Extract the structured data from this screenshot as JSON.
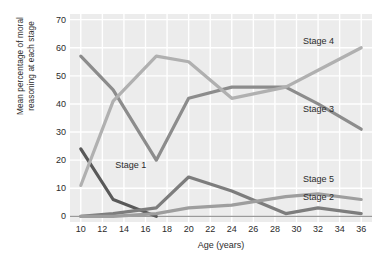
{
  "chart_data": {
    "type": "line",
    "title": "",
    "xlabel": "Age (years)",
    "ylabel": "Mean percentage of moral\nreasoning at each stage",
    "xlim": [
      9,
      37
    ],
    "ylim": [
      -2,
      72
    ],
    "yticks": [
      0,
      10,
      20,
      30,
      40,
      50,
      60,
      70
    ],
    "xticks": [
      10,
      12,
      14,
      16,
      18,
      20,
      22,
      24,
      26,
      28,
      30,
      32,
      34,
      36
    ],
    "grid": true,
    "legend": "inline-series-labels",
    "x": [
      10,
      13,
      17,
      20,
      24,
      29,
      32,
      36
    ],
    "series": [
      {
        "name": "Stage 1",
        "color": "#595959",
        "x": [
          10,
          13,
          17
        ],
        "values": [
          24,
          6,
          0
        ],
        "label": "Stage 1",
        "label_x": 13.2,
        "label_y": 18
      },
      {
        "name": "Stage 2",
        "color": "#7d7d7d",
        "x": [
          10,
          13,
          17,
          20,
          24,
          29,
          32,
          36
        ],
        "values": [
          0,
          1,
          3,
          14,
          9,
          1,
          3,
          1
        ],
        "label": "Stage 2",
        "label_x": 30.6,
        "label_y": 6.5
      },
      {
        "name": "Stage 3",
        "color": "#8c8c8c",
        "x": [
          10,
          13,
          17,
          20,
          24,
          29,
          32,
          36
        ],
        "values": [
          57,
          45,
          20,
          42,
          46,
          46,
          40,
          31
        ],
        "label": "Stage 3",
        "label_x": 30.6,
        "label_y": 38
      },
      {
        "name": "Stage 4",
        "color": "#b0b0b0",
        "x": [
          10,
          13,
          17,
          20,
          24,
          29,
          32,
          36
        ],
        "values": [
          11,
          41,
          57,
          55,
          42,
          46,
          52,
          60
        ],
        "label": "Stage 4",
        "label_x": 30.6,
        "label_y": 62
      },
      {
        "name": "Stage 5",
        "color": "#9e9e9e",
        "x": [
          10,
          13,
          17,
          20,
          24,
          29,
          32,
          36
        ],
        "values": [
          0,
          0,
          1,
          3,
          4,
          7,
          8,
          6
        ],
        "label": "Stage 5",
        "label_x": 30.6,
        "label_y": 13
      }
    ]
  },
  "colors": {
    "plot_background": "#ececec",
    "gridline": "#ffffff",
    "axis": "#9a9a9a",
    "text": "#2b2b2b"
  }
}
